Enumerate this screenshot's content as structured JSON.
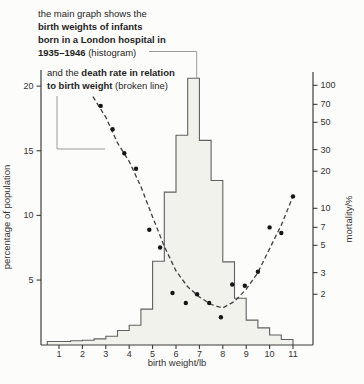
{
  "figure": {
    "annotation_histogram": {
      "line1": "the main graph shows the",
      "line2": "birth weights of infants",
      "line3": "born in a London hospital in",
      "line4_bold": "1935–1946",
      "line4_rest": " (histogram)"
    },
    "annotation_mortality": {
      "line1_pre": "and the ",
      "line1_bold": "death rate in relation",
      "line2_bold": "to birth weight",
      "line2_rest": " (broken line)"
    }
  },
  "colors": {
    "background": "#fcfcfa",
    "axis": "#3d3d3d",
    "tick_text": "#333333",
    "histogram_fill": "#f2f2ed",
    "histogram_stroke": "#606060",
    "broken_line": "#3f3f3f",
    "dot": "#151515",
    "connector": "#9b9b9b"
  },
  "chart_data": {
    "type": "bar",
    "subtype": "histogram_with_log_scatter_line",
    "xlabel": "birth weight/lb",
    "ylabel_left": "percentage of population",
    "ylabel_right": "mortality/%",
    "x_ticks": [
      1,
      2,
      3,
      4,
      5,
      6,
      7,
      8,
      9,
      10,
      11
    ],
    "y_left_ticks": [
      5,
      10,
      15,
      20
    ],
    "y_left_range": [
      0,
      21
    ],
    "y_right_ticks": [
      2,
      3,
      5,
      7,
      10,
      20,
      30,
      50,
      70,
      100
    ],
    "y_right_scale": "log",
    "y_right_range": [
      1.55,
      100
    ],
    "histogram": {
      "bin_width_lb": 0.5,
      "bin_left_edges": [
        0.5,
        1.0,
        1.5,
        2.0,
        2.5,
        3.0,
        3.5,
        4.0,
        4.5,
        5.0,
        5.5,
        6.0,
        6.5,
        7.0,
        7.5,
        8.0,
        8.5,
        9.0,
        9.5,
        10.0,
        10.5
      ],
      "percent": [
        0.25,
        0.25,
        0.3,
        0.35,
        0.45,
        0.65,
        1.1,
        1.5,
        2.75,
        6.45,
        11.8,
        16.2,
        20.6,
        15.8,
        12.7,
        6.4,
        3.6,
        1.9,
        1.3,
        0.75,
        0.4
      ]
    },
    "mortality_points": [
      [
        2.78,
        68
      ],
      [
        3.29,
        44
      ],
      [
        3.79,
        28
      ],
      [
        4.29,
        21
      ],
      [
        4.86,
        6.7
      ],
      [
        5.32,
        4.8
      ],
      [
        5.85,
        2.05
      ],
      [
        6.42,
        1.7
      ],
      [
        6.9,
        2.0
      ],
      [
        7.42,
        1.7
      ],
      [
        7.92,
        1.3
      ],
      [
        8.4,
        2.4
      ],
      [
        8.94,
        2.35
      ],
      [
        9.5,
        3.05
      ],
      [
        10.0,
        7.0
      ],
      [
        10.5,
        6.3
      ],
      [
        11.0,
        12.5
      ]
    ],
    "mortality_trend": [
      [
        2.45,
        81
      ],
      [
        3.0,
        55
      ],
      [
        3.5,
        34
      ],
      [
        4.0,
        24
      ],
      [
        4.5,
        15
      ],
      [
        5.0,
        8.5
      ],
      [
        5.5,
        4.9
      ],
      [
        6.0,
        3.1
      ],
      [
        6.5,
        2.3
      ],
      [
        7.0,
        1.9
      ],
      [
        7.5,
        1.65
      ],
      [
        8.0,
        1.55
      ],
      [
        8.5,
        1.75
      ],
      [
        9.0,
        2.2
      ],
      [
        9.5,
        3.0
      ],
      [
        10.0,
        4.7
      ],
      [
        10.5,
        7.3
      ],
      [
        11.0,
        12.5
      ]
    ]
  }
}
